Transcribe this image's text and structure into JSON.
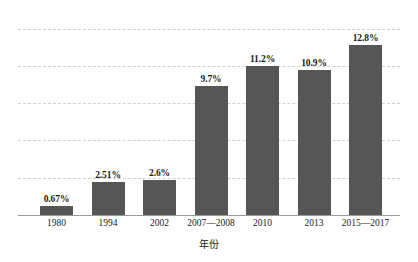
{
  "chart_data": {
    "type": "bar",
    "title": "",
    "subtitle": "",
    "xlabel": "年份",
    "ylabel": "",
    "categories": [
      "1980",
      "1994",
      "2002",
      "2007—2008",
      "2010",
      "2013",
      "2015—2017"
    ],
    "values": [
      0.67,
      2.51,
      2.6,
      9.7,
      11.2,
      10.9,
      12.8
    ],
    "value_labels": [
      "0.67%",
      "2.51%",
      "2.6%",
      "9.7%",
      "11.2%",
      "10.9%",
      "12.8%"
    ],
    "unit": "%",
    "ylim": [
      0,
      14
    ],
    "ytick_values": [
      2.8,
      5.6,
      8.4,
      11.2,
      14.0
    ],
    "ytick_labels": [],
    "grid": true,
    "grid_style": "dashed",
    "grid_color": "#cfcfcf",
    "legend": false,
    "legend_position": "none",
    "bar_color": "#565656",
    "axis_color": "#9a9a9a",
    "background_color": "#ffffff",
    "label_color": "#1a1a1a",
    "annotations": []
  },
  "axis": {
    "x_title": "年份"
  }
}
